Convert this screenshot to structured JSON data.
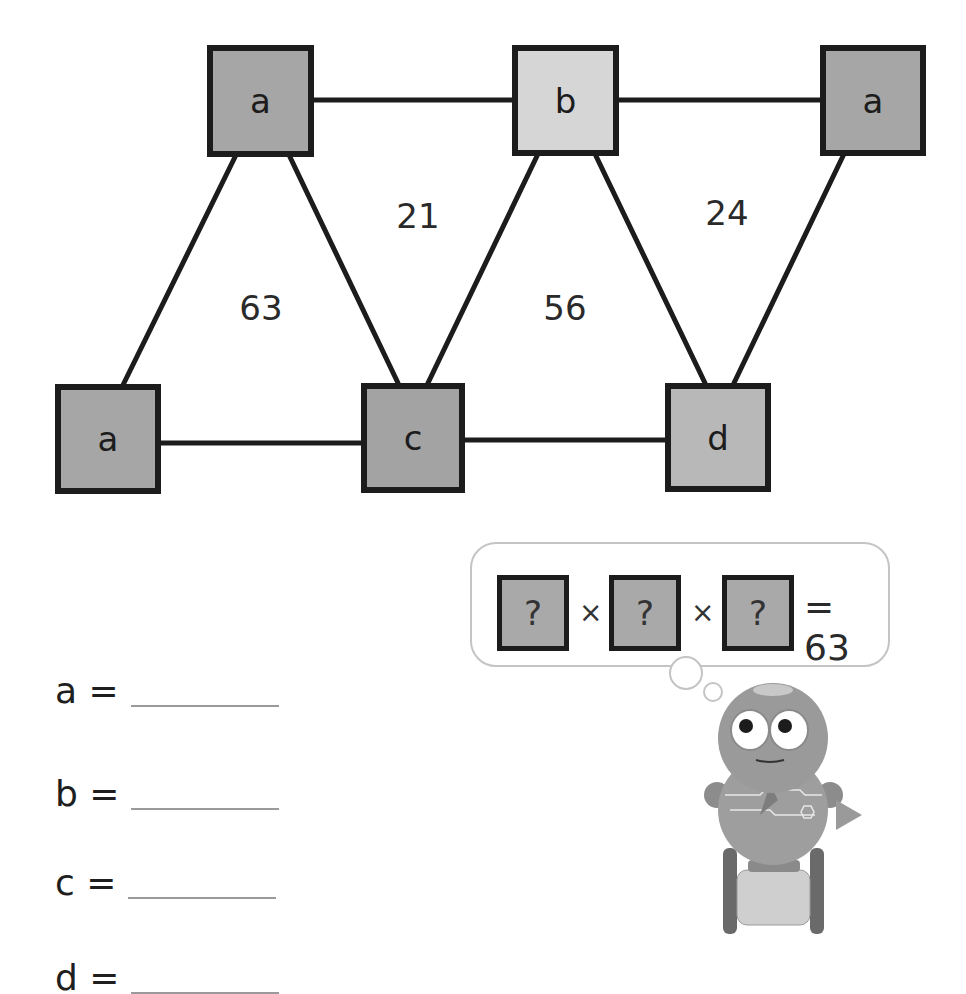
{
  "diagram": {
    "nodes": [
      {
        "id": "top-left",
        "label": "a",
        "fill": "#a6a6a6"
      },
      {
        "id": "top-middle",
        "label": "b",
        "fill": "#d6d6d6"
      },
      {
        "id": "top-right",
        "label": "a",
        "fill": "#a6a6a6"
      },
      {
        "id": "bottom-left",
        "label": "a",
        "fill": "#a6a6a6"
      },
      {
        "id": "bottom-middle",
        "label": "c",
        "fill": "#a3a3a3"
      },
      {
        "id": "bottom-right",
        "label": "d",
        "fill": "#b8b8b8"
      }
    ],
    "triangle_products": [
      {
        "value": "63"
      },
      {
        "value": "21"
      },
      {
        "value": "56"
      },
      {
        "value": "24"
      }
    ]
  },
  "thought_bubble": {
    "box1": "?",
    "op1": "×",
    "box2": "?",
    "op2": "×",
    "box3": "?",
    "result": "= 63"
  },
  "answers": [
    {
      "label": "a ="
    },
    {
      "label": "b ="
    },
    {
      "label": "c ="
    },
    {
      "label": "d ="
    }
  ]
}
